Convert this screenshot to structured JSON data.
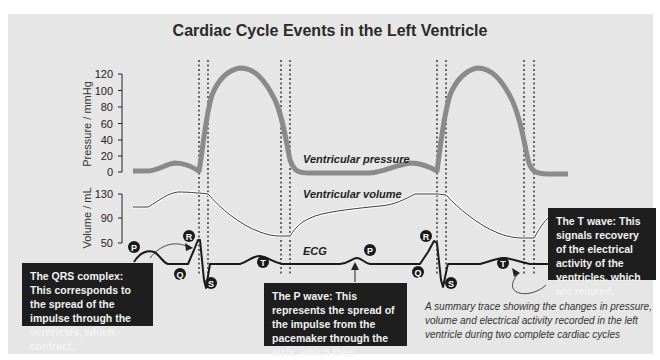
{
  "title": "Cardiac Cycle Events in the Left Ventricle",
  "pressure_axis": {
    "label": "Pressure / mmHg",
    "ticks": [
      "120",
      "100",
      "80",
      "60",
      "40",
      "20",
      "0"
    ]
  },
  "volume_axis": {
    "label": "Volume / mL",
    "ticks": [
      "130",
      "90",
      "50"
    ]
  },
  "trace_labels": {
    "pressure": "Ventricular pressure",
    "volume": "Ventricular volume",
    "ecg": "ECG"
  },
  "ecg_markers": {
    "p": "P",
    "q": "Q",
    "r": "R",
    "s": "S",
    "t": "T"
  },
  "callouts": {
    "qrs": "The QRS complex: This corresponds to the spread of the impulse through the ventricles, which contract.",
    "p_wave": "The P wave: This represents the spread of the impulse from the pacemaker through the atria, which then contract.",
    "t_wave": "The T wave: This signals recovery of the electrical activity of the ventricles, which are relaxed."
  },
  "caption": "A summary trace showing the changes in pressure, volume and electrical activity recorded in the left ventricle during two complete cardiac cycles",
  "colors": {
    "pressure_trace": "#8a8a8a",
    "background": "#e6e6e6",
    "callout_bg": "#1e1e1e"
  }
}
